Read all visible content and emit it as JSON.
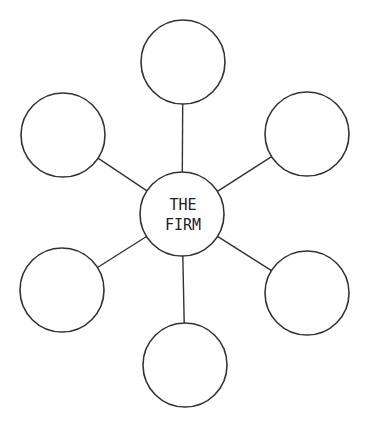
{
  "diagram": {
    "title": "THE FIRM",
    "center": {
      "label_lines": [
        "THE",
        "FIRM"
      ],
      "cx": 182,
      "cy": 214,
      "r": 42
    },
    "satellites": [
      {
        "position": "top",
        "cx": 183,
        "cy": 62,
        "r": 42,
        "label": ""
      },
      {
        "position": "upper-left",
        "cx": 63,
        "cy": 135,
        "r": 42,
        "label": ""
      },
      {
        "position": "upper-right",
        "cx": 307,
        "cy": 134,
        "r": 42,
        "label": ""
      },
      {
        "position": "lower-left",
        "cx": 62,
        "cy": 290,
        "r": 42,
        "label": ""
      },
      {
        "position": "lower-right",
        "cx": 307,
        "cy": 293,
        "r": 42,
        "label": ""
      },
      {
        "position": "bottom",
        "cx": 185,
        "cy": 365,
        "r": 42,
        "label": ""
      }
    ],
    "colors": {
      "stroke": "#333333",
      "background": "#ffffff",
      "text": "#222222"
    }
  }
}
